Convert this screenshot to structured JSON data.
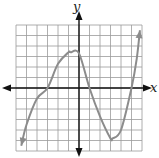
{
  "chart_data": {
    "type": "line",
    "title": "",
    "xlabel": "x",
    "ylabel": "y",
    "xlim": [
      -6,
      6
    ],
    "ylim": [
      -6,
      6
    ],
    "grid": true,
    "grid_step": 1,
    "tick_labels": false,
    "series": [
      {
        "name": "cubic",
        "description": "Cubic polynomial with roots near x=-3, x=1, x=5; local max near (-0.8, 3.4), local min near (3.2, -4.8); arrows at both ends",
        "x": [
          -5.5,
          -5,
          -4,
          -3,
          -2,
          -1,
          -0.8,
          0,
          1,
          2,
          3,
          3.2,
          4,
          5,
          5.5,
          5.8
        ],
        "y": [
          -5.5,
          -3.5,
          -1.0,
          0,
          2.3,
          3.4,
          3.4,
          3.3,
          0,
          -2.7,
          -4.8,
          -4.8,
          -4.0,
          0,
          2.8,
          5.5
        ]
      }
    ],
    "colors": {
      "grid": "#9a9a9a",
      "axes": "#111111",
      "curve": "#8c8c8c"
    }
  },
  "labels": {
    "x_axis": "x",
    "y_axis": "y"
  }
}
